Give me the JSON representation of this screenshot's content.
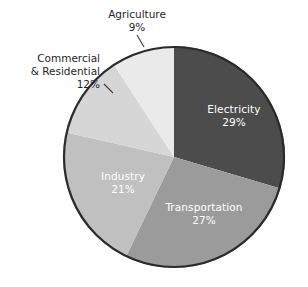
{
  "chart_data": {
    "type": "pie",
    "title": "",
    "subtitle": "",
    "xlabel": "",
    "ylabel": "",
    "legend_position": "none",
    "grid": false,
    "total": 98,
    "unit": "%",
    "start_angle_deg": 0,
    "direction": "clockwise",
    "categories": [
      "Electricity",
      "Transportation",
      "Industry",
      "Commercial & Residential",
      "Agriculture"
    ],
    "values": [
      29,
      27,
      21,
      12,
      9
    ],
    "slices": [
      {
        "name": "Electricity",
        "value": 29,
        "value_label": "29%",
        "color": "#4c4c4c",
        "label_placement": "inside",
        "label_color": "#ffffff"
      },
      {
        "name": "Transportation",
        "value": 27,
        "value_label": "27%",
        "color": "#9b9b9b",
        "label_placement": "inside",
        "label_color": "#ffffff"
      },
      {
        "name": "Industry",
        "value": 21,
        "value_label": "21%",
        "color": "#c0c0c0",
        "label_placement": "inside",
        "label_color": "#ffffff"
      },
      {
        "name": "Commercial & Residential",
        "value": 12,
        "value_label": "12%",
        "color": "#d6d6d6",
        "label_placement": "outside",
        "label_color": "#262626"
      },
      {
        "name": "Agriculture",
        "value": 9,
        "value_label": "9%",
        "color": "#eaeaea",
        "label_placement": "outside",
        "label_color": "#262626"
      }
    ]
  },
  "labels": {
    "electricity": {
      "name": "Electricity",
      "pct": "29%"
    },
    "transportation": {
      "name": "Transportation",
      "pct": "27%"
    },
    "industry": {
      "name": "Industry",
      "pct": "21%"
    },
    "commercial_residential": {
      "line1": "Commercial",
      "line2": "& Residential",
      "pct": "12%"
    },
    "agriculture": {
      "line1": "Agriculture",
      "pct": "9%"
    }
  },
  "style": {
    "background": "#ffffff",
    "outline_color": "#2b2b2b",
    "leader_color": "#3a3a3a",
    "inside_text_color": "#ffffff",
    "outside_text_color": "#262626"
  },
  "geometry": {
    "center_x": 174,
    "center_y": 157,
    "radius": 111
  }
}
